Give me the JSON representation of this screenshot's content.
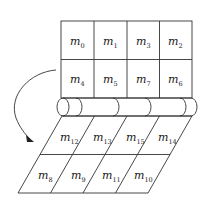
{
  "diagram": {
    "top_grid": {
      "rows": [
        [
          {
            "base": "m",
            "sub": "0"
          },
          {
            "base": "m",
            "sub": "1"
          },
          {
            "base": "m",
            "sub": "3"
          },
          {
            "base": "m",
            "sub": "2"
          }
        ],
        [
          {
            "base": "m",
            "sub": "4"
          },
          {
            "base": "m",
            "sub": "5"
          },
          {
            "base": "m",
            "sub": "7"
          },
          {
            "base": "m",
            "sub": "6"
          }
        ]
      ]
    },
    "bottom_grid": {
      "rows": [
        [
          {
            "base": "m",
            "sub": "12"
          },
          {
            "base": "m",
            "sub": "13"
          },
          {
            "base": "m",
            "sub": "15"
          },
          {
            "base": "m",
            "sub": "14"
          }
        ],
        [
          {
            "base": "m",
            "sub": "8"
          },
          {
            "base": "m",
            "sub": "9"
          },
          {
            "base": "m",
            "sub": "11"
          },
          {
            "base": "m",
            "sub": "10"
          }
        ]
      ]
    },
    "fold_arrow": {
      "direction": "top-to-bottom, curving left"
    },
    "colors": {
      "line": "#333333",
      "background": "#ffffff",
      "text": "#1a1a1a"
    }
  }
}
